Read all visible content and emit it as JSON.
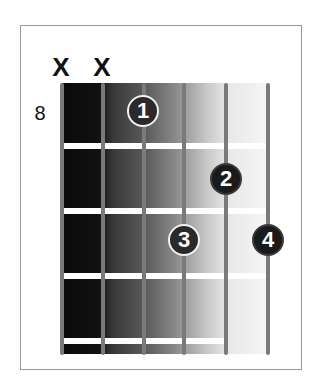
{
  "chord_diagram": {
    "type": "guitar-chord-chart",
    "starting_fret_label": "8",
    "mutes": [
      {
        "string": 6,
        "label": "X"
      },
      {
        "string": 5,
        "label": "X"
      }
    ],
    "strings": 6,
    "frets_shown": 4,
    "fingers": [
      {
        "number": "1",
        "string": 4,
        "fret": 1
      },
      {
        "number": "2",
        "string": 2,
        "fret": 2
      },
      {
        "number": "3",
        "string": 3,
        "fret": 3
      },
      {
        "number": "4",
        "string": 1,
        "fret": 3
      }
    ],
    "colors": {
      "string": "#7a7a7a",
      "fret": "#ffffff",
      "finger_fill": "#2a2a2a",
      "finger_text": "#ffffff",
      "frame_border": "#9a9a9a"
    }
  }
}
